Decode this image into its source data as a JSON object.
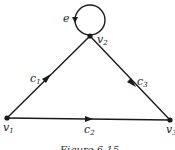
{
  "diagram": {
    "type": "directed-graph",
    "vertices": [
      {
        "id": "v1",
        "label": "v",
        "sub": "1",
        "x": 7,
        "y": 118
      },
      {
        "id": "v2",
        "label": "v",
        "sub": "2",
        "x": 90,
        "y": 36
      },
      {
        "id": "v3",
        "label": "v",
        "sub": "3",
        "x": 170,
        "y": 120
      }
    ],
    "edges": [
      {
        "id": "c1",
        "label": "c",
        "sub": "1",
        "from": "v1",
        "to": "v2"
      },
      {
        "id": "c2",
        "label": "c",
        "sub": "2",
        "from": "v1",
        "to": "v3"
      },
      {
        "id": "c3",
        "label": "c",
        "sub": "3",
        "from": "v2",
        "to": "v3"
      },
      {
        "id": "e",
        "label": "e",
        "from": "v2",
        "to": "v2",
        "kind": "loop"
      }
    ],
    "caption": "Figure 6.15",
    "colors": {
      "stroke": "#1a1a1a",
      "background": "#ffffff"
    }
  }
}
